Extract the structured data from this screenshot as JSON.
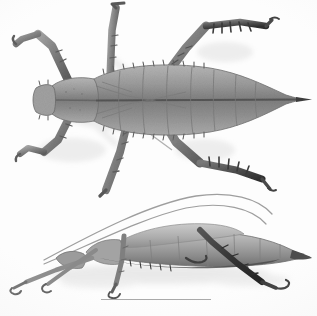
{
  "plate": {
    "title": "Spiny stick insect specimen plate",
    "background_color": "#fdfdfd",
    "medium": "grayscale photographic plate",
    "width": 317,
    "height": 316
  },
  "figures": [
    {
      "id": "dorsal-view",
      "label": "dorsal view",
      "description": "Whole insect photographed from above, head at left, tapering abdomen tip at right, six spiny legs splayed outward",
      "orientation": "head-left",
      "body_color": "#8e8e8e",
      "body_shadow_color": "#d9d9d9",
      "parts": [
        "head",
        "pronotum",
        "mesothorax",
        "metathorax",
        "abdomen",
        "foreleg-left",
        "foreleg-right",
        "midleg-left",
        "midleg-right",
        "hindleg-left",
        "hindleg-right",
        "cerci"
      ]
    },
    {
      "id": "lateral-view",
      "label": "lateral view",
      "description": "Whole insect photographed from the side resting on a pale surface, long filiform antennae arching up and back, dark hind femur and tibia",
      "orientation": "head-left",
      "body_color": "#9a9a9a",
      "body_shadow_color": "#cfcfcf",
      "parts": [
        "antenna-upper",
        "antenna-lower",
        "head",
        "thorax",
        "abdomen",
        "foreleg",
        "midleg",
        "hindleg",
        "tarsus"
      ]
    }
  ],
  "scale": {
    "bar_present": true,
    "bar_color": "#a9a9a9",
    "bar_left_px": 101,
    "bar_width_px": 110,
    "caption_text": "",
    "caption_note": "caption text cropped by lower image edge"
  },
  "palette": {
    "paper": "#fdfdfd",
    "specimen_mid": "#8e8e8e",
    "specimen_dark": "#3a3a3a",
    "specimen_light": "#c4c4c4",
    "shadow": "#dcdcdc",
    "rule": "#a9a9a9"
  }
}
